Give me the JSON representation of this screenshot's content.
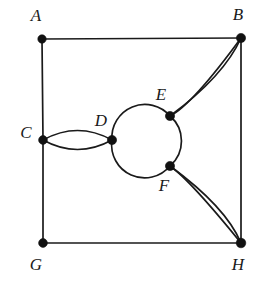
{
  "figure": {
    "background_color": "#ffffff",
    "edge_color": "#1a1a1a",
    "vertex_color": "#111111",
    "label_color": "#1a1a1a",
    "width": 260,
    "height": 287
  },
  "vertices": [
    {
      "id": "A",
      "label": "A",
      "x": 42,
      "y": 39,
      "r": 4.2,
      "label_x": 36,
      "label_y": 17
    },
    {
      "id": "B",
      "label": "B",
      "x": 241,
      "y": 38,
      "r": 4.6,
      "label_x": 238,
      "label_y": 16
    },
    {
      "id": "C",
      "label": "C",
      "x": 43,
      "y": 140,
      "r": 4.4,
      "label_x": 26,
      "label_y": 134
    },
    {
      "id": "D",
      "label": "D",
      "x": 112,
      "y": 140,
      "r": 4.6,
      "label_x": 101,
      "label_y": 122
    },
    {
      "id": "E",
      "label": "E",
      "x": 170,
      "y": 116,
      "r": 4.6,
      "label_x": 161,
      "label_y": 96
    },
    {
      "id": "F",
      "label": "F",
      "x": 170,
      "y": 166,
      "r": 4.6,
      "label_x": 164,
      "label_y": 187
    },
    {
      "id": "G",
      "label": "G",
      "x": 43,
      "y": 243,
      "r": 4.4,
      "label_x": 36,
      "label_y": 266
    },
    {
      "id": "H",
      "label": "H",
      "x": 241,
      "y": 243,
      "r": 4.8,
      "label_x": 238,
      "label_y": 266
    }
  ],
  "edges": [
    {
      "name": "edge-A-B",
      "from": "A",
      "to": "B",
      "kind": "straight",
      "path": "M 42 39 L 241 38"
    },
    {
      "name": "edge-A-C",
      "from": "A",
      "to": "C",
      "kind": "straight",
      "path": "M 42 39 L 43 140"
    },
    {
      "name": "edge-C-G",
      "from": "C",
      "to": "G",
      "kind": "straight",
      "path": "M 43 140 L 43 243"
    },
    {
      "name": "edge-G-H",
      "from": "G",
      "to": "H",
      "kind": "straight",
      "path": "M 43 243 L 241 243"
    },
    {
      "name": "edge-B-H",
      "from": "B",
      "to": "H",
      "kind": "straight",
      "path": "M 241 38 L 241 243"
    },
    {
      "name": "edge-C-D-upper",
      "from": "C",
      "to": "D",
      "kind": "curved",
      "path": "M 43 140 Q 77.5 121 112 140"
    },
    {
      "name": "edge-C-D-lower",
      "from": "C",
      "to": "D",
      "kind": "curved",
      "path": "M 43 140 Q 77.5 159 112 140"
    },
    {
      "name": "edge-D-E-arc",
      "from": "D",
      "to": "E",
      "kind": "curved",
      "path": "M 112 140 A 33 33 0 0 1 170 116"
    },
    {
      "name": "edge-E-F-arc",
      "from": "E",
      "to": "F",
      "kind": "curved",
      "path": "M 170 116 A 33 33 0 0 1 170 166"
    },
    {
      "name": "edge-F-D-arc",
      "from": "F",
      "to": "D",
      "kind": "curved",
      "path": "M 170 166 A 33 33 0 0 1 112 140"
    },
    {
      "name": "edge-E-B-outer",
      "from": "E",
      "to": "B",
      "kind": "curved",
      "path": "M 170 116 Q 192 105 241 38"
    },
    {
      "name": "edge-E-B-inner",
      "from": "E",
      "to": "B",
      "kind": "curved",
      "path": "M 170 116 Q 224 76 241 38"
    },
    {
      "name": "edge-F-H-outer",
      "from": "F",
      "to": "H",
      "kind": "curved",
      "path": "M 170 166 Q 190 180 241 243"
    },
    {
      "name": "edge-F-H-inner",
      "from": "F",
      "to": "H",
      "kind": "curved",
      "path": "M 170 166 Q 226 207 241 243"
    }
  ],
  "graph_summary": {
    "vertex_count": 8,
    "edge_count": 14,
    "vertex_labels": [
      "A",
      "B",
      "C",
      "D",
      "E",
      "F",
      "G",
      "H"
    ],
    "multi_edges": [
      "C-D (2)",
      "E-B (2)",
      "F-H (2)"
    ]
  }
}
